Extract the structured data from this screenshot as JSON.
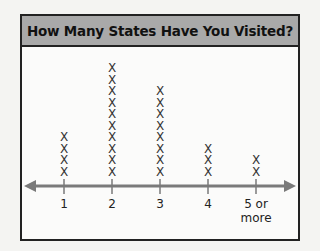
{
  "chart_data": {
    "type": "line-plot (dot plot)",
    "title": "How Many States Have You Visited?",
    "categories": [
      "1",
      "2",
      "3",
      "4",
      "5 or more"
    ],
    "values": [
      4,
      10,
      8,
      3,
      2
    ],
    "marker": "X",
    "xlabel": "",
    "ylabel": "",
    "axis": "number line with arrows on both ends",
    "grid": false,
    "colors": {
      "header_bg": "#a9a9a9",
      "axis": "#777777",
      "border": "#222222"
    }
  },
  "labels": [
    "1",
    "2",
    "3",
    "4",
    "5 or",
    "more"
  ]
}
